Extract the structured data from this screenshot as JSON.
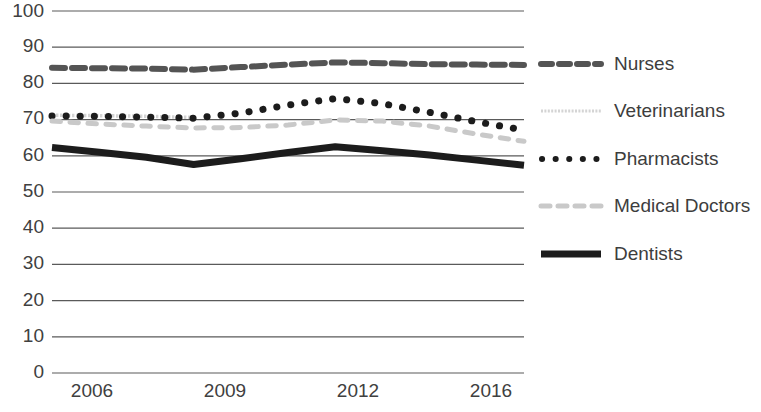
{
  "chart_data": {
    "type": "line",
    "title": "",
    "xlabel": "",
    "ylabel": "",
    "ylim": [
      0,
      100
    ],
    "ytick_step": 10,
    "yticks": [
      "0",
      "10",
      "20",
      "30",
      "40",
      "50",
      "60",
      "70",
      "80",
      "90",
      "100"
    ],
    "categories": [
      "2006",
      "2007",
      "2008",
      "2009",
      "2010",
      "2011",
      "2012",
      "2013",
      "2014",
      "2015",
      "2016"
    ],
    "xtick_labels": [
      "2006",
      "2009",
      "2012",
      "2016"
    ],
    "grid": "horizontal",
    "legend_position": "right",
    "series": [
      {
        "name": "Nurses",
        "style": "dashed",
        "color": "#545454",
        "values": [
          84.3,
          84.2,
          84.1,
          83.8,
          84.5,
          85.2,
          85.8,
          85.6,
          85.3,
          85.2,
          85.1
        ]
      },
      {
        "name": "Veterinarians",
        "style": "light-dotted",
        "color": "#d4d4d4",
        "values": [
          71.2,
          71.1,
          70.9,
          70.6,
          null,
          null,
          null,
          null,
          null,
          null,
          null
        ]
      },
      {
        "name": "Pharmacists",
        "style": "dotted",
        "color": "#1c1c1c",
        "values": [
          71.0,
          70.9,
          70.7,
          70.4,
          71.8,
          74.0,
          75.8,
          74.4,
          72.0,
          69.4,
          67.1
        ]
      },
      {
        "name": "Medical Doctors",
        "style": "light-dashed",
        "color": "#c9c9c9",
        "values": [
          69.6,
          68.8,
          68.2,
          67.7,
          67.8,
          68.5,
          69.9,
          69.6,
          68.2,
          66.0,
          64.0
        ]
      },
      {
        "name": "Dentists",
        "style": "thick-solid",
        "color": "#1c1c1c",
        "values": [
          62.3,
          61.0,
          59.6,
          57.6,
          59.2,
          60.9,
          62.5,
          61.4,
          60.2,
          58.8,
          57.4
        ]
      }
    ]
  },
  "legend": {
    "items": [
      {
        "label": "Nurses",
        "swatch": "dashed-dark-swatch"
      },
      {
        "label": "Veterinarians",
        "swatch": "thin-light-swatch"
      },
      {
        "label": "Pharmacists",
        "swatch": "dotted-dark-swatch"
      },
      {
        "label": "Medical Doctors",
        "swatch": "dashed-light-swatch"
      },
      {
        "label": "Dentists",
        "swatch": "solid-thick-swatch"
      }
    ]
  },
  "y_axis": {
    "t100": "100",
    "t90": "90",
    "t80": "80",
    "t70": "70",
    "t60": "60",
    "t50": "50",
    "t40": "40",
    "t30": "30",
    "t20": "20",
    "t10": "10",
    "t0": "0"
  },
  "x_axis": {
    "t2006": "2006",
    "t2009": "2009",
    "t2012": "2012",
    "t2016": "2016"
  }
}
